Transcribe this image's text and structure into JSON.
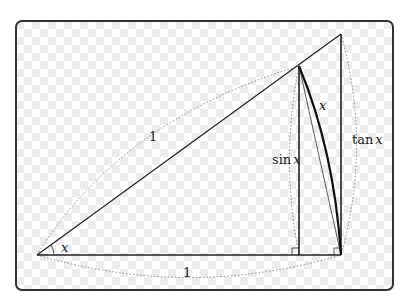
{
  "diagram": {
    "colors": {
      "background": "#ffffff",
      "checker_light": "#ffffff",
      "checker_dark": "#ececec",
      "frame": "#333333",
      "line": "#222222",
      "dotted": "#888888"
    },
    "points": {
      "O": [
        37,
        255
      ],
      "A": [
        341,
        255
      ],
      "P": [
        299,
        66
      ],
      "F": [
        299,
        255
      ],
      "T": [
        341,
        34
      ]
    },
    "labels": {
      "radius_hyp": "1",
      "radius_base": "1",
      "angle": "x",
      "arc": "x",
      "sin": "sin",
      "sin_var": "x",
      "tan": "tan",
      "tan_var": "x"
    }
  }
}
